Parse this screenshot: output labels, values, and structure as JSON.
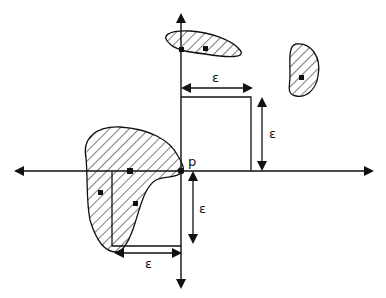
{
  "diagram": {
    "point_label": "p",
    "epsilon_label": "ε",
    "labels": {
      "eps_top": "ε",
      "eps_right": "ε",
      "eps_down": "ε",
      "eps_bottom": "ε",
      "point": "p"
    },
    "colors": {
      "stroke": "#111111",
      "background": "#ffffff"
    },
    "regions": [
      {
        "name": "top-cluster",
        "points": 2
      },
      {
        "name": "right-cluster",
        "points": 1
      },
      {
        "name": "left-cluster",
        "points": 4
      }
    ]
  }
}
